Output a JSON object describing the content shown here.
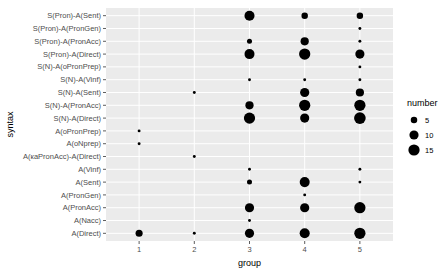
{
  "chart_data": {
    "type": "scatter",
    "title": "",
    "xlabel": "group",
    "ylabel": "syntax",
    "x_categories": [
      "1",
      "2",
      "3",
      "4",
      "5"
    ],
    "y_categories": [
      "A(Direct)",
      "A(Nacc)",
      "A(PronAcc)",
      "A(PronGen)",
      "A(Sent)",
      "A(Vinf)",
      "A(каPronAcc)-A(Direct)",
      "A(oNprep)",
      "A(oPronPrep)",
      "S(N)-A(Direct)",
      "S(N)-A(PronAcc)",
      "S(N)-A(Sent)",
      "S(N)-A(Vinf)",
      "S(N)-A(oPronPrep)",
      "S(Pron)-A(Direct)",
      "S(Pron)-A(PronAcc)",
      "S(Pron)-A(PronGen)",
      "S(Pron)-A(Sent)"
    ],
    "size_variable": "number",
    "legend": {
      "title": "number",
      "entries": [
        5,
        10,
        15
      ],
      "position": "right"
    },
    "grid": true,
    "points": [
      {
        "x": "1",
        "y": "A(Direct)",
        "number": 6
      },
      {
        "x": "1",
        "y": "A(oNprep)",
        "number": 1
      },
      {
        "x": "1",
        "y": "A(oPronPrep)",
        "number": 1
      },
      {
        "x": "2",
        "y": "A(Direct)",
        "number": 1
      },
      {
        "x": "2",
        "y": "A(каPronAcc)-A(Direct)",
        "number": 1
      },
      {
        "x": "2",
        "y": "S(N)-A(Sent)",
        "number": 1
      },
      {
        "x": "3",
        "y": "A(Direct)",
        "number": 10
      },
      {
        "x": "3",
        "y": "A(Nacc)",
        "number": 1
      },
      {
        "x": "3",
        "y": "A(PronAcc)",
        "number": 10
      },
      {
        "x": "3",
        "y": "A(Sent)",
        "number": 3
      },
      {
        "x": "3",
        "y": "A(Vinf)",
        "number": 1
      },
      {
        "x": "3",
        "y": "S(N)-A(Direct)",
        "number": 15
      },
      {
        "x": "3",
        "y": "S(N)-A(PronAcc)",
        "number": 8
      },
      {
        "x": "3",
        "y": "S(N)-A(Vinf)",
        "number": 1
      },
      {
        "x": "3",
        "y": "S(Pron)-A(Direct)",
        "number": 12
      },
      {
        "x": "3",
        "y": "S(Pron)-A(PronAcc)",
        "number": 3
      },
      {
        "x": "3",
        "y": "S(Pron)-A(Sent)",
        "number": 12
      },
      {
        "x": "4",
        "y": "A(Direct)",
        "number": 12
      },
      {
        "x": "4",
        "y": "A(PronAcc)",
        "number": 10
      },
      {
        "x": "4",
        "y": "A(PronGen)",
        "number": 1
      },
      {
        "x": "4",
        "y": "A(Sent)",
        "number": 12
      },
      {
        "x": "4",
        "y": "S(N)-A(Direct)",
        "number": 10
      },
      {
        "x": "4",
        "y": "S(N)-A(PronAcc)",
        "number": 15
      },
      {
        "x": "4",
        "y": "S(N)-A(Sent)",
        "number": 10
      },
      {
        "x": "4",
        "y": "S(N)-A(Vinf)",
        "number": 1
      },
      {
        "x": "4",
        "y": "S(Pron)-A(Direct)",
        "number": 15
      },
      {
        "x": "4",
        "y": "S(Pron)-A(PronAcc)",
        "number": 8
      },
      {
        "x": "4",
        "y": "S(Pron)-A(Sent)",
        "number": 5
      },
      {
        "x": "5",
        "y": "A(Direct)",
        "number": 15
      },
      {
        "x": "5",
        "y": "A(PronAcc)",
        "number": 15
      },
      {
        "x": "5",
        "y": "A(Sent)",
        "number": 1
      },
      {
        "x": "5",
        "y": "A(Vinf)",
        "number": 1
      },
      {
        "x": "5",
        "y": "S(N)-A(Direct)",
        "number": 16
      },
      {
        "x": "5",
        "y": "S(N)-A(PronAcc)",
        "number": 15
      },
      {
        "x": "5",
        "y": "S(N)-A(Sent)",
        "number": 8
      },
      {
        "x": "5",
        "y": "S(N)-A(Vinf)",
        "number": 1
      },
      {
        "x": "5",
        "y": "S(N)-A(oPronPrep)",
        "number": 1
      },
      {
        "x": "5",
        "y": "S(Pron)-A(Direct)",
        "number": 10
      },
      {
        "x": "5",
        "y": "S(Pron)-A(PronAcc)",
        "number": 1
      },
      {
        "x": "5",
        "y": "S(Pron)-A(PronGen)",
        "number": 1
      },
      {
        "x": "5",
        "y": "S(Pron)-A(Sent)",
        "number": 5
      }
    ]
  },
  "colors": {
    "panel_bg": "#ebebeb",
    "grid_major": "#ffffff",
    "point": "#000000",
    "tick_text": "#4d4d4d",
    "tick_mark": "#333333"
  }
}
